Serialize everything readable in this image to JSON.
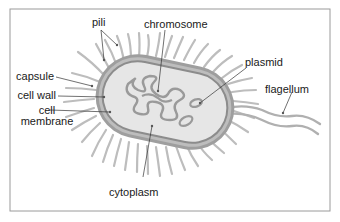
{
  "diagram": {
    "colors": {
      "frame": "#9a9a9a",
      "pili": "#bdbdbd",
      "capsule": "#9e9e9e",
      "cell_wall": "#b5b5b5",
      "membrane": "#8c8c8c",
      "cytoplasm": "#e6e6e6",
      "chromosome": "#9a9a9a",
      "leader_line": "#333333",
      "text": "#1a1a1a"
    },
    "labels": {
      "pili": "pili",
      "chromosome": "chromosome",
      "plasmid": "plasmid",
      "capsule": "capsule",
      "cell_wall": "cell wall",
      "cell_membrane_line1": "cell",
      "cell_membrane_line2": "membrane",
      "flagellum": "flagellum",
      "cytoplasm": "cytoplasm"
    }
  }
}
